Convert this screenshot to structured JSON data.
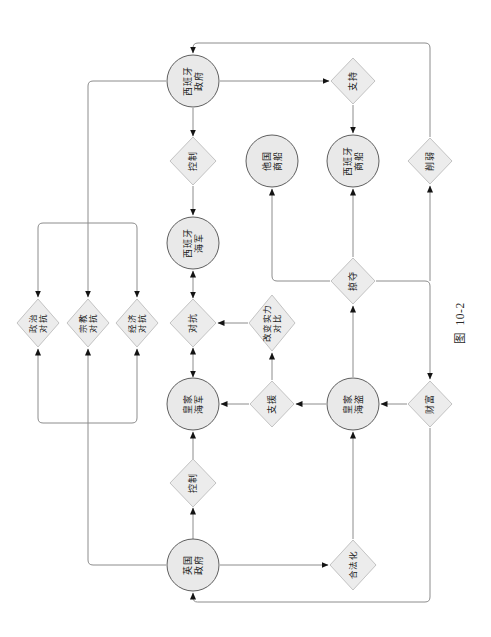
{
  "figure": {
    "caption": "图  10-2"
  },
  "colors": {
    "background": "#ffffff",
    "edge_line": "#8c8c8c",
    "arrowhead": "#141414",
    "circle_fill": "#e9e9e9",
    "circle_stroke": "#5f5f5f",
    "diamond_fill": "#ececec",
    "diamond_stroke": "#c3c3c3",
    "text": "#1c1c1c"
  },
  "diagram": {
    "orientation": "rotated-90-ccw",
    "nodes": [
      {
        "id": "uk-government",
        "shape": "circle",
        "label": "英国政府",
        "lines": [
          "英国",
          "政府"
        ]
      },
      {
        "id": "control-left",
        "shape": "diamond",
        "label": "控制",
        "lines": [
          "控制"
        ]
      },
      {
        "id": "royal-navy",
        "shape": "circle",
        "label": "皇家海军",
        "lines": [
          "皇家",
          "海军"
        ]
      },
      {
        "id": "confrontation",
        "shape": "diamond",
        "label": "对抗",
        "lines": [
          "对抗"
        ]
      },
      {
        "id": "spanish-navy",
        "shape": "circle",
        "label": "西班牙海军",
        "lines": [
          "西班牙",
          "海军"
        ]
      },
      {
        "id": "control-right",
        "shape": "diamond",
        "label": "控制",
        "lines": [
          "控制"
        ]
      },
      {
        "id": "spanish-government",
        "shape": "circle",
        "label": "西班牙政府",
        "lines": [
          "西班牙",
          "政府"
        ]
      },
      {
        "id": "political-confrontation",
        "shape": "diamond",
        "label": "政治对抗",
        "lines": [
          "政治",
          "对抗"
        ]
      },
      {
        "id": "religious-confrontation",
        "shape": "diamond",
        "label": "宗教对抗",
        "lines": [
          "宗教",
          "对抗"
        ]
      },
      {
        "id": "economic-confrontation",
        "shape": "diamond",
        "label": "经济对抗",
        "lines": [
          "经济",
          "对抗"
        ]
      },
      {
        "id": "assist",
        "shape": "diamond",
        "label": "支援",
        "lines": [
          "支援"
        ]
      },
      {
        "id": "balance-of-power",
        "shape": "diamond",
        "label": "改变实力对比",
        "lines": [
          "改变实力",
          "对比"
        ]
      },
      {
        "id": "royal-pirates",
        "shape": "circle",
        "label": "皇家海盗",
        "lines": [
          "皇家",
          "海盗"
        ]
      },
      {
        "id": "other-merchant-ships",
        "shape": "circle",
        "label": "他国商船",
        "lines": [
          "他国",
          "商船"
        ]
      },
      {
        "id": "spanish-merchant-ships",
        "shape": "circle",
        "label": "西班牙商船",
        "lines": [
          "西班牙",
          "商船"
        ]
      },
      {
        "id": "plunder",
        "shape": "diamond",
        "label": "掠夺",
        "lines": [
          "掠夺"
        ]
      },
      {
        "id": "legalization",
        "shape": "diamond",
        "label": "合法化",
        "lines": [
          "合法化"
        ]
      },
      {
        "id": "support",
        "shape": "diamond",
        "label": "支持",
        "lines": [
          "支持"
        ]
      },
      {
        "id": "wealth",
        "shape": "diamond",
        "label": "财富",
        "lines": [
          "财富"
        ]
      },
      {
        "id": "weaken",
        "shape": "diamond",
        "label": "削弱",
        "lines": [
          "削弱"
        ]
      }
    ],
    "edges": [
      {
        "from": "uk-government",
        "to": "control-left",
        "bidirectional": false
      },
      {
        "from": "control-left",
        "to": "royal-navy",
        "bidirectional": false
      },
      {
        "from": "royal-navy",
        "to": "confrontation",
        "bidirectional": true
      },
      {
        "from": "confrontation",
        "to": "spanish-navy",
        "bidirectional": true
      },
      {
        "from": "spanish-government",
        "to": "control-right",
        "bidirectional": false
      },
      {
        "from": "control-right",
        "to": "spanish-navy",
        "bidirectional": false
      },
      {
        "from": "uk-government",
        "to": "religious-confrontation",
        "bidirectional": false
      },
      {
        "from": "uk-government",
        "to": "political-confrontation",
        "bidirectional": false
      },
      {
        "from": "uk-government",
        "to": "economic-confrontation",
        "bidirectional": false
      },
      {
        "from": "spanish-government",
        "to": "religious-confrontation",
        "bidirectional": false
      },
      {
        "from": "spanish-government",
        "to": "political-confrontation",
        "bidirectional": false
      },
      {
        "from": "spanish-government",
        "to": "economic-confrontation",
        "bidirectional": false
      },
      {
        "from": "assist",
        "to": "royal-navy",
        "bidirectional": false
      },
      {
        "from": "royal-pirates",
        "to": "assist",
        "bidirectional": false
      },
      {
        "from": "assist",
        "to": "balance-of-power",
        "bidirectional": false
      },
      {
        "from": "balance-of-power",
        "to": "confrontation",
        "bidirectional": false
      },
      {
        "from": "uk-government",
        "to": "legalization",
        "bidirectional": false
      },
      {
        "from": "legalization",
        "to": "royal-pirates",
        "bidirectional": false
      },
      {
        "from": "royal-pirates",
        "to": "plunder",
        "bidirectional": false
      },
      {
        "from": "plunder",
        "to": "spanish-merchant-ships",
        "bidirectional": false
      },
      {
        "from": "plunder",
        "to": "other-merchant-ships",
        "bidirectional": false
      },
      {
        "from": "plunder",
        "to": "wealth",
        "bidirectional": false
      },
      {
        "from": "plunder",
        "to": "weaken",
        "bidirectional": false
      },
      {
        "from": "wealth",
        "to": "royal-pirates",
        "bidirectional": false
      },
      {
        "from": "wealth",
        "to": "uk-government",
        "bidirectional": false
      },
      {
        "from": "weaken",
        "to": "spanish-government",
        "bidirectional": false
      },
      {
        "from": "spanish-government",
        "to": "support",
        "bidirectional": false
      },
      {
        "from": "support",
        "to": "spanish-merchant-ships",
        "bidirectional": false
      }
    ]
  }
}
